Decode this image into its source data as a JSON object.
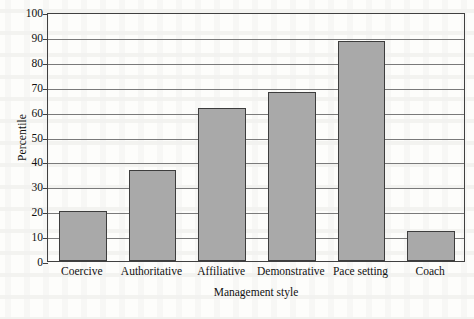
{
  "chart_data": {
    "type": "bar",
    "title": "",
    "xlabel": "Management style",
    "ylabel": "Percentile",
    "categories": [
      "Coercive",
      "Authoritative",
      "Affiliative",
      "Demonstrative",
      "Pace setting",
      "Coach"
    ],
    "values": [
      20,
      36.5,
      61.5,
      68,
      88.5,
      12
    ],
    "ylim": [
      0,
      100
    ],
    "yticks": [
      0,
      10,
      20,
      30,
      40,
      50,
      60,
      70,
      80,
      90,
      100
    ],
    "ytick_labels": [
      "0",
      "10",
      "20",
      "30",
      "40",
      "50",
      "60",
      "70",
      "80",
      "90",
      "100"
    ],
    "grid": true,
    "grid_axis": "y",
    "legend": false,
    "bar_fill_color": "#a9a9a9",
    "bar_edge_color": "#3d3d3d",
    "frame_color": "#404040",
    "gridline_color": "#7a7a7a",
    "background_color": "#fdfdfb"
  }
}
